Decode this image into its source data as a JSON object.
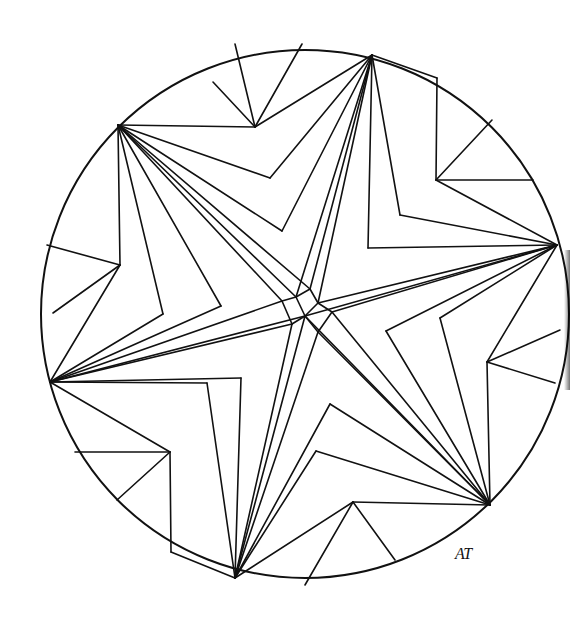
{
  "drawing": {
    "title": "Star mandala line drawing",
    "stroke_color": "#111111",
    "background": "#ffffff",
    "circle": {
      "cx": 305,
      "cy": 314,
      "r": 264
    },
    "star_points": [
      [
        118,
        125
      ],
      [
        372,
        55
      ],
      [
        557,
        245
      ],
      [
        490,
        505
      ],
      [
        235,
        578
      ],
      [
        50,
        382
      ]
    ],
    "signature": "AT"
  },
  "lines": [
    [
      118,
      125,
      255,
      127
    ],
    [
      255,
      127,
      372,
      55
    ],
    [
      255,
      127,
      213,
      82
    ],
    [
      255,
      127,
      235,
      44
    ],
    [
      255,
      127,
      302,
      44
    ],
    [
      118,
      125,
      270,
      178
    ],
    [
      270,
      178,
      372,
      55
    ],
    [
      118,
      125,
      282,
      231
    ],
    [
      282,
      231,
      372,
      55
    ],
    [
      372,
      55,
      437,
      78
    ],
    [
      437,
      78,
      436,
      180
    ],
    [
      436,
      180,
      557,
      245
    ],
    [
      436,
      180,
      492,
      120
    ],
    [
      436,
      180,
      533,
      180
    ],
    [
      372,
      55,
      400,
      215
    ],
    [
      400,
      215,
      557,
      245
    ],
    [
      372,
      55,
      368,
      248
    ],
    [
      368,
      248,
      557,
      245
    ],
    [
      557,
      245,
      487,
      362
    ],
    [
      487,
      362,
      490,
      505
    ],
    [
      487,
      362,
      560,
      330
    ],
    [
      487,
      362,
      555,
      383
    ],
    [
      557,
      245,
      440,
      318
    ],
    [
      440,
      318,
      490,
      505
    ],
    [
      557,
      245,
      386,
      331
    ],
    [
      386,
      331,
      490,
      505
    ],
    [
      490,
      505,
      353,
      502
    ],
    [
      353,
      502,
      235,
      578
    ],
    [
      353,
      502,
      395,
      560
    ],
    [
      353,
      502,
      305,
      585
    ],
    [
      490,
      505,
      330,
      404
    ],
    [
      330,
      404,
      235,
      578
    ],
    [
      490,
      505,
      316,
      451
    ],
    [
      316,
      451,
      235,
      578
    ],
    [
      235,
      578,
      171,
      552
    ],
    [
      171,
      552,
      170,
      452
    ],
    [
      170,
      452,
      50,
      382
    ],
    [
      170,
      452,
      75,
      452
    ],
    [
      170,
      452,
      117,
      500
    ],
    [
      235,
      578,
      207,
      383
    ],
    [
      207,
      383,
      50,
      382
    ],
    [
      235,
      578,
      241,
      378
    ],
    [
      241,
      378,
      50,
      382
    ],
    [
      50,
      382,
      120,
      265
    ],
    [
      120,
      265,
      118,
      125
    ],
    [
      120,
      265,
      47,
      245
    ],
    [
      120,
      265,
      53,
      313
    ],
    [
      50,
      382,
      163,
      314
    ],
    [
      163,
      314,
      118,
      125
    ],
    [
      50,
      382,
      221,
      306
    ],
    [
      221,
      306,
      118,
      125
    ],
    [
      118,
      125,
      296,
      297
    ],
    [
      118,
      125,
      282,
      301
    ],
    [
      118,
      125,
      310,
      289
    ],
    [
      372,
      55,
      296,
      297
    ],
    [
      372,
      55,
      310,
      289
    ],
    [
      372,
      55,
      318,
      303
    ],
    [
      557,
      245,
      318,
      303
    ],
    [
      557,
      245,
      332,
      312
    ],
    [
      557,
      245,
      305,
      316
    ],
    [
      490,
      505,
      332,
      312
    ],
    [
      490,
      505,
      318,
      332
    ],
    [
      490,
      505,
      305,
      316
    ],
    [
      235,
      578,
      318,
      332
    ],
    [
      235,
      578,
      292,
      324
    ],
    [
      235,
      578,
      305,
      316
    ],
    [
      50,
      382,
      292,
      324
    ],
    [
      50,
      382,
      282,
      301
    ],
    [
      50,
      382,
      305,
      316
    ],
    [
      296,
      297,
      310,
      289
    ],
    [
      310,
      289,
      318,
      303
    ],
    [
      318,
      303,
      305,
      316
    ],
    [
      305,
      316,
      296,
      297
    ],
    [
      318,
      303,
      332,
      312
    ],
    [
      332,
      312,
      318,
      332
    ],
    [
      318,
      332,
      305,
      316
    ],
    [
      305,
      316,
      292,
      324
    ],
    [
      292,
      324,
      282,
      301
    ],
    [
      282,
      301,
      296,
      297
    ]
  ]
}
